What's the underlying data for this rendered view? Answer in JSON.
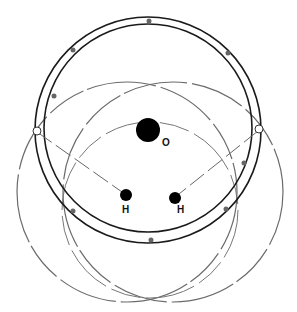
{
  "diagram": {
    "atoms": [
      {
        "label": "O",
        "cx": 148,
        "cy": 130,
        "r": 12,
        "label_x": 162,
        "label_y": 145
      },
      {
        "label": "H",
        "cx": 126,
        "cy": 195,
        "r": 6,
        "label_x": 122,
        "label_y": 212
      },
      {
        "label": "H",
        "cx": 175,
        "cy": 198,
        "r": 6,
        "label_x": 177,
        "label_y": 212
      }
    ],
    "colors": {
      "atom": "#000000",
      "outer_shell": "#1a1a1a",
      "h_orbitals": "#6b6b6b",
      "electron": "#666666"
    }
  }
}
